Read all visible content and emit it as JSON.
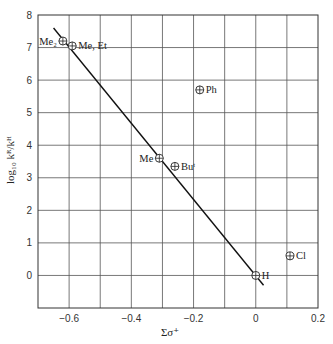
{
  "chart_data": {
    "type": "scatter",
    "title": "",
    "xlabel": "Σσ⁺",
    "ylabel": "log₁₀ kᴿ/kᴴ",
    "xlim": [
      -0.7,
      0.2
    ],
    "ylim": [
      -1,
      8
    ],
    "grid": true,
    "x_ticks": [
      -0.6,
      -0.4,
      -0.2,
      0,
      0.2
    ],
    "x_tick_labels": [
      "−0.6",
      "−0.4",
      "−0.2",
      "0",
      "0.2"
    ],
    "y_ticks": [
      0,
      1,
      2,
      3,
      4,
      5,
      6,
      7,
      8
    ],
    "y_tick_labels": [
      "0",
      "1",
      "2",
      "3",
      "4",
      "5",
      "6",
      "7",
      "8"
    ],
    "points": [
      {
        "label": "Me₂",
        "x": -0.62,
        "y": 7.2,
        "label_side": "left"
      },
      {
        "label": "Me, Et",
        "x": -0.59,
        "y": 7.05,
        "label_side": "right"
      },
      {
        "label": "Ph",
        "x": -0.18,
        "y": 5.7,
        "label_side": "right"
      },
      {
        "label": "Me",
        "x": -0.31,
        "y": 3.6,
        "label_side": "left"
      },
      {
        "label": "Buᵗ",
        "x": -0.26,
        "y": 3.35,
        "label_side": "right"
      },
      {
        "label": "H",
        "x": 0.0,
        "y": 0.0,
        "label_side": "right"
      },
      {
        "label": "Cl",
        "x": 0.11,
        "y": 0.6,
        "label_side": "right"
      }
    ],
    "fit_line": {
      "x": [
        -0.65,
        0.025
      ],
      "y": [
        7.6,
        -0.3
      ]
    },
    "marker": "circled-plus"
  }
}
